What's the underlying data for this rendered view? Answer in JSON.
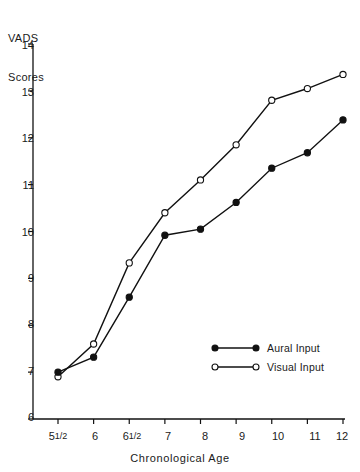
{
  "chart_data": {
    "type": "line",
    "title": "",
    "xlabel": "Chronological Age",
    "ylabel_line1": "VADS",
    "ylabel_line2": "Scores",
    "categories": [
      "5 1/2",
      "6",
      "6 1/2",
      "7",
      "8",
      "9",
      "10",
      "11",
      "12"
    ],
    "x_tick_labels": [
      {
        "main": "5",
        "frac": "1/2"
      },
      {
        "main": "6",
        "frac": ""
      },
      {
        "main": "6",
        "frac": "1/2"
      },
      {
        "main": "7",
        "frac": ""
      },
      {
        "main": "8",
        "frac": ""
      },
      {
        "main": "9",
        "frac": ""
      },
      {
        "main": "10",
        "frac": ""
      },
      {
        "main": "11",
        "frac": ""
      },
      {
        "main": "12",
        "frac": ""
      }
    ],
    "y_tick_labels": [
      "14",
      "13",
      "12",
      "11",
      "10",
      "9",
      "8",
      "7",
      "6"
    ],
    "ylim": [
      6,
      14
    ],
    "y_ticks": [
      6,
      7,
      8,
      9,
      10,
      11,
      12,
      13,
      14
    ],
    "grid": false,
    "legend_position": "inside-lower-right",
    "series": [
      {
        "name": "Aural Input",
        "marker": "filled-circle",
        "values": [
          7.0,
          7.32,
          8.6,
          9.92,
          10.05,
          10.62,
          11.35,
          11.68,
          12.38
        ]
      },
      {
        "name": "Visual Input",
        "marker": "open-circle",
        "values": [
          6.9,
          7.6,
          9.33,
          10.4,
          11.1,
          11.85,
          12.8,
          13.05,
          13.35
        ]
      }
    ],
    "legend": [
      {
        "label": "Aural Input",
        "marker": "filled-circle"
      },
      {
        "label": "Visual Input",
        "marker": "open-circle"
      }
    ],
    "colors": {
      "line": "#111111",
      "axis": "#111111",
      "background": "#ffffff",
      "marker_fill_aural": "#111111",
      "marker_fill_visual": "#ffffff"
    }
  }
}
